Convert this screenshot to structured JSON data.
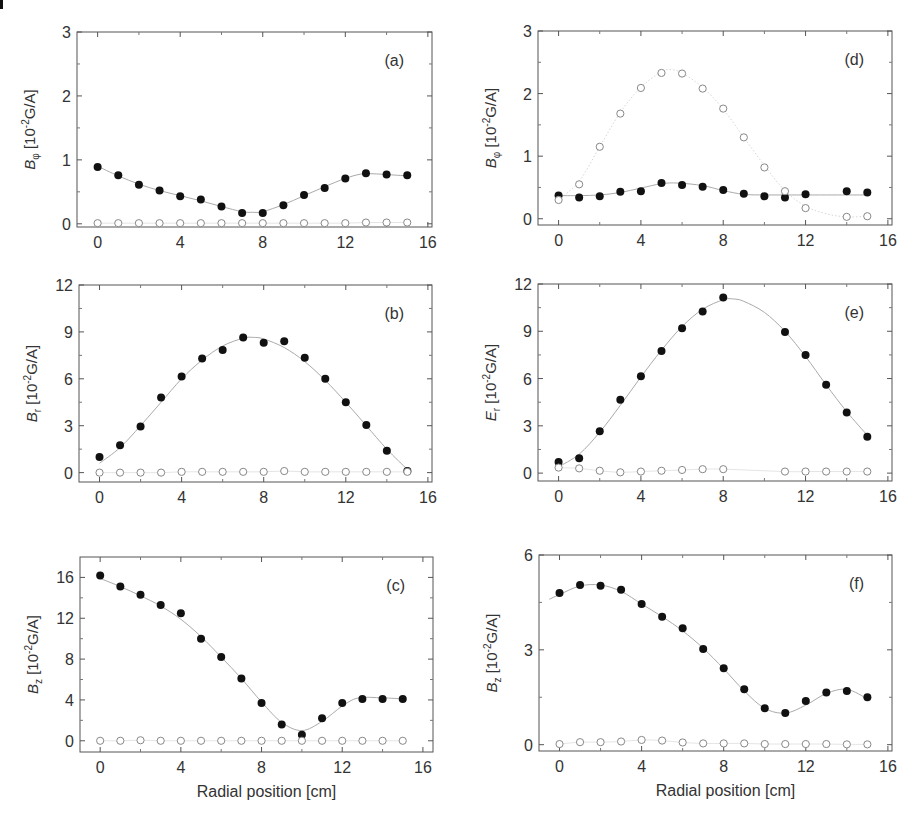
{
  "figure": {
    "x_axis_label": "Radial position [cm]"
  },
  "chart_data": [
    {
      "id": "a",
      "type": "scatter",
      "panel_label": "(a)",
      "ylabel_main": "B",
      "ylabel_sub": "φ",
      "ylabel_unit": "[10",
      "ylabel_exp": "-2",
      "ylabel_tail": "G/A]",
      "xlim": [
        -1,
        16.2
      ],
      "ylim": [
        -0.05,
        3
      ],
      "xticks": [
        0,
        4,
        8,
        12,
        16
      ],
      "yticks": [
        0,
        1,
        2,
        3
      ],
      "frame": {
        "left": 77,
        "top": 32,
        "right": 432,
        "bottom": 227
      },
      "series": [
        {
          "name": "filled",
          "marker": "filled-circle",
          "x": [
            0,
            1,
            2,
            3,
            4,
            5,
            6,
            7,
            8,
            9,
            10,
            11,
            12,
            13,
            14,
            15
          ],
          "y": [
            0.89,
            0.76,
            0.61,
            0.52,
            0.43,
            0.38,
            0.27,
            0.17,
            0.17,
            0.29,
            0.45,
            0.56,
            0.71,
            0.79,
            0.77,
            0.76
          ]
        },
        {
          "name": "open",
          "marker": "open-circle",
          "x": [
            0,
            1,
            2,
            3,
            4,
            5,
            6,
            7,
            8,
            9,
            10,
            11,
            12,
            13,
            14,
            15
          ],
          "y": [
            0.01,
            0.01,
            0.01,
            0.01,
            0.01,
            0.01,
            0.01,
            0.01,
            0.01,
            0.01,
            0.01,
            0.01,
            0.01,
            0.02,
            0.02,
            0.02
          ]
        }
      ],
      "fit": {
        "x": [
          0,
          1,
          2,
          3,
          4,
          5,
          6,
          7,
          7.5,
          8,
          9,
          10,
          11,
          12,
          12.8,
          13.5,
          14,
          15
        ],
        "y": [
          0.9,
          0.75,
          0.62,
          0.52,
          0.44,
          0.36,
          0.27,
          0.19,
          0.18,
          0.19,
          0.3,
          0.44,
          0.58,
          0.71,
          0.78,
          0.78,
          0.77,
          0.75
        ]
      }
    },
    {
      "id": "b",
      "type": "scatter",
      "panel_label": "(b)",
      "ylabel_main": "B",
      "ylabel_sub": "r",
      "ylabel_unit": "[10",
      "ylabel_exp": "-2",
      "ylabel_tail": "G/A]",
      "xlim": [
        -1,
        16.2
      ],
      "ylim": [
        -0.6,
        12
      ],
      "xticks": [
        0,
        4,
        8,
        12,
        16
      ],
      "yticks": [
        0,
        3,
        6,
        9,
        12
      ],
      "frame": {
        "left": 79,
        "top": 285,
        "right": 432,
        "bottom": 482
      },
      "series": [
        {
          "name": "filled",
          "marker": "filled-circle",
          "x": [
            0,
            1,
            2,
            3,
            4,
            5,
            6,
            7,
            8,
            9,
            10,
            11,
            12,
            13,
            14,
            15
          ],
          "y": [
            1.0,
            1.75,
            2.95,
            4.8,
            6.15,
            7.3,
            7.85,
            8.65,
            8.3,
            8.4,
            7.35,
            6.0,
            4.5,
            3.05,
            1.4,
            0.1
          ]
        },
        {
          "name": "open",
          "marker": "open-circle",
          "x": [
            0,
            1,
            2,
            3,
            4,
            5,
            6,
            7,
            8,
            9,
            10,
            11,
            12,
            13,
            14,
            15
          ],
          "y": [
            0,
            0,
            0,
            0,
            0.05,
            0.05,
            0.05,
            0.05,
            0.05,
            0.1,
            0.05,
            0.05,
            0.05,
            0.05,
            0.05,
            0.05
          ]
        }
      ],
      "fit": {
        "x": [
          0,
          1,
          2,
          3,
          4,
          5,
          6,
          7,
          7.5,
          8,
          9,
          10,
          11,
          12,
          13,
          14,
          15
        ],
        "y": [
          0.6,
          1.6,
          3.0,
          4.5,
          6.0,
          7.2,
          8.1,
          8.6,
          8.65,
          8.55,
          8.0,
          7.1,
          5.9,
          4.5,
          3.0,
          1.5,
          0.2
        ]
      }
    },
    {
      "id": "c",
      "type": "scatter",
      "panel_label": "(c)",
      "ylabel_main": "B",
      "ylabel_sub": "z",
      "ylabel_unit": "[10",
      "ylabel_exp": "-2",
      "ylabel_tail": "G/A]",
      "xlim": [
        -1,
        16.5
      ],
      "ylim": [
        -1.1,
        18
      ],
      "xticks": [
        0,
        4,
        8,
        12,
        16
      ],
      "yticks": [
        0,
        4,
        8,
        12,
        16
      ],
      "frame": {
        "left": 80,
        "top": 557,
        "right": 433,
        "bottom": 752
      },
      "series": [
        {
          "name": "filled",
          "marker": "filled-circle",
          "x": [
            0,
            1,
            2,
            3,
            4,
            5,
            6,
            7,
            8,
            9,
            10,
            11,
            12,
            13,
            14,
            15
          ],
          "y": [
            16.2,
            15.1,
            14.3,
            13.3,
            12.5,
            10.0,
            8.2,
            6.1,
            3.7,
            1.6,
            0.6,
            2.2,
            3.7,
            4.1,
            4.1,
            4.1
          ]
        },
        {
          "name": "open",
          "marker": "open-circle",
          "x": [
            0,
            1,
            2,
            3,
            4,
            5,
            6,
            7,
            8,
            9,
            10,
            11,
            12,
            13,
            14,
            15
          ],
          "y": [
            0,
            0,
            0.05,
            0,
            0,
            0,
            0,
            0,
            0,
            0,
            0,
            0,
            0,
            0,
            0,
            0
          ]
        }
      ],
      "fit": {
        "x": [
          0,
          1,
          2,
          3,
          4,
          5,
          6,
          7,
          8,
          9,
          10,
          11,
          12,
          12.8,
          14,
          15
        ],
        "y": [
          15.9,
          15.1,
          14.2,
          13.2,
          11.9,
          10.2,
          8.2,
          6.1,
          3.8,
          1.8,
          1.0,
          1.9,
          3.4,
          4.2,
          4.2,
          4.1
        ]
      }
    },
    {
      "id": "d",
      "type": "scatter",
      "panel_label": "(d)",
      "ylabel_main": "B",
      "ylabel_sub": "φ",
      "ylabel_unit": "[10",
      "ylabel_exp": "-2",
      "ylabel_tail": "G/A]",
      "xlim": [
        -1,
        16.2
      ],
      "ylim": [
        -0.1,
        3
      ],
      "xticks": [
        0,
        4,
        8,
        12,
        16
      ],
      "yticks": [
        0,
        1,
        2,
        3
      ],
      "frame": {
        "left": 538,
        "top": 31,
        "right": 892,
        "bottom": 225
      },
      "series": [
        {
          "name": "filled",
          "marker": "filled-circle",
          "x": [
            0,
            1,
            2,
            3,
            4,
            5,
            6,
            7,
            8,
            9,
            10,
            11,
            12,
            14,
            15
          ],
          "y": [
            0.37,
            0.34,
            0.36,
            0.43,
            0.44,
            0.57,
            0.54,
            0.51,
            0.46,
            0.4,
            0.36,
            0.34,
            0.39,
            0.44,
            0.42
          ]
        },
        {
          "name": "open",
          "marker": "open-circle",
          "x": [
            0,
            1,
            2,
            3,
            4,
            5,
            6,
            7,
            8,
            9,
            10,
            11,
            12,
            14,
            15
          ],
          "y": [
            0.3,
            0.55,
            1.15,
            1.68,
            2.09,
            2.33,
            2.32,
            2.08,
            1.76,
            1.3,
            0.82,
            0.44,
            0.17,
            0.03,
            0.04
          ]
        }
      ],
      "fit": {
        "x": [
          0,
          1,
          2,
          3,
          4,
          5,
          5.8,
          7,
          8,
          9,
          10,
          11,
          12,
          14,
          15
        ],
        "y": [
          0.37,
          0.37,
          0.38,
          0.42,
          0.49,
          0.56,
          0.57,
          0.53,
          0.45,
          0.39,
          0.38,
          0.38,
          0.38,
          0.38,
          0.38
        ]
      },
      "fit_open": {
        "x": [
          0,
          1,
          2,
          3,
          4,
          5,
          5.5,
          6,
          7,
          8,
          9,
          10,
          11,
          12,
          13,
          14,
          15
        ],
        "y": [
          0.3,
          0.6,
          1.15,
          1.7,
          2.1,
          2.35,
          2.38,
          2.33,
          2.1,
          1.75,
          1.3,
          0.85,
          0.45,
          0.2,
          0.08,
          0.03,
          0.04
        ]
      }
    },
    {
      "id": "e",
      "type": "scatter",
      "panel_label": "(e)",
      "ylabel_main": "E",
      "ylabel_sub": "r",
      "ylabel_unit": "[10",
      "ylabel_exp": "-2",
      "ylabel_tail": "G/A]",
      "xlim": [
        -1,
        16.2
      ],
      "ylim": [
        -0.5,
        12
      ],
      "xticks": [
        0,
        4,
        8,
        12,
        16
      ],
      "yticks": [
        0,
        3,
        6,
        9,
        12
      ],
      "frame": {
        "left": 538,
        "top": 284,
        "right": 892,
        "bottom": 481
      },
      "series": [
        {
          "name": "filled",
          "marker": "filled-circle",
          "x": [
            0,
            1,
            2,
            3,
            4,
            5,
            6,
            7,
            8,
            11,
            12,
            13,
            14,
            15
          ],
          "y": [
            0.7,
            0.95,
            2.65,
            4.65,
            6.15,
            7.75,
            9.2,
            10.25,
            11.15,
            8.95,
            7.5,
            5.6,
            3.85,
            2.3
          ]
        },
        {
          "name": "open",
          "marker": "open-circle",
          "x": [
            0,
            1,
            2,
            3,
            4,
            5,
            6,
            7,
            8,
            11,
            12,
            13,
            14,
            15
          ],
          "y": [
            0.35,
            0.3,
            0.15,
            0.05,
            0.1,
            0.15,
            0.2,
            0.25,
            0.25,
            0.1,
            0.1,
            0.1,
            0.1,
            0.1
          ]
        }
      ],
      "fit": {
        "x": [
          0,
          1,
          2,
          3,
          4,
          5,
          6,
          7,
          8,
          8.5,
          9,
          10,
          11,
          12,
          13,
          14,
          15
        ],
        "y": [
          0.4,
          1.2,
          2.6,
          4.3,
          6.1,
          7.8,
          9.3,
          10.4,
          11.0,
          11.05,
          10.9,
          10.2,
          9.0,
          7.4,
          5.6,
          3.9,
          2.4
        ]
      }
    },
    {
      "id": "f",
      "type": "scatter",
      "panel_label": "(f)",
      "ylabel_main": "B",
      "ylabel_sub": "z",
      "ylabel_unit": "[10",
      "ylabel_exp": "-2",
      "ylabel_tail": "G/A]",
      "xlim": [
        -1,
        16.2
      ],
      "ylim": [
        -0.2,
        6
      ],
      "xticks": [
        0,
        4,
        8,
        12,
        16
      ],
      "yticks": [
        0,
        3,
        6
      ],
      "frame": {
        "left": 539,
        "top": 555,
        "right": 892,
        "bottom": 751
      },
      "series": [
        {
          "name": "filled",
          "marker": "filled-circle",
          "x": [
            0,
            1,
            2,
            3,
            4,
            5,
            6,
            7,
            8,
            9,
            10,
            11,
            12,
            13,
            14,
            15
          ],
          "y": [
            4.8,
            5.05,
            5.03,
            4.9,
            4.45,
            4.05,
            3.68,
            3.03,
            2.42,
            1.75,
            1.15,
            1.0,
            1.38,
            1.65,
            1.7,
            1.5
          ]
        },
        {
          "name": "open",
          "marker": "open-circle",
          "x": [
            0,
            1,
            2,
            3,
            4,
            5,
            6,
            7,
            8,
            9,
            10,
            11,
            12,
            13,
            14,
            15
          ],
          "y": [
            0.02,
            0.08,
            0.08,
            0.1,
            0.15,
            0.13,
            0.07,
            0.04,
            0.04,
            0.04,
            0.02,
            0.02,
            0.02,
            0.02,
            0.01,
            0.01
          ]
        }
      ],
      "fit": {
        "x": [
          -0.5,
          0,
          1,
          2,
          3,
          4,
          5,
          6,
          7,
          8,
          9,
          10,
          11,
          12,
          13,
          14,
          15
        ],
        "y": [
          4.6,
          4.75,
          5.02,
          5.05,
          4.85,
          4.45,
          4.05,
          3.6,
          3.05,
          2.4,
          1.7,
          1.15,
          1.0,
          1.25,
          1.62,
          1.75,
          1.45
        ]
      }
    }
  ]
}
